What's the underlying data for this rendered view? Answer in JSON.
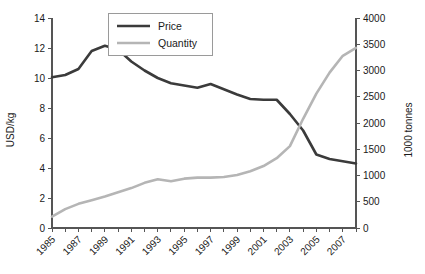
{
  "chart_data": {
    "type": "line",
    "title": "",
    "xlabel": "",
    "ylabel": "USD/kg",
    "y2label": "1000 tonnes",
    "grid": false,
    "legend_position": "top-center",
    "xlim": [
      1985,
      2008
    ],
    "ylim": [
      0,
      14
    ],
    "y2lim": [
      0,
      4000
    ],
    "x": [
      1985,
      1986,
      1987,
      1988,
      1989,
      1990,
      1991,
      1992,
      1993,
      1994,
      1995,
      1996,
      1997,
      1998,
      1999,
      2000,
      2001,
      2002,
      2003,
      2004,
      2005,
      2006,
      2007,
      2008
    ],
    "xticks": [
      1985,
      1987,
      1989,
      1991,
      1993,
      1995,
      1997,
      1999,
      2001,
      2003,
      2005,
      2007
    ],
    "xtick_labels": [
      "1985",
      "1987",
      "1989",
      "1991",
      "1993",
      "1995",
      "1997",
      "1999",
      "2001",
      "2003",
      "2005",
      "2007"
    ],
    "yticks": [
      0,
      2,
      4,
      6,
      8,
      10,
      12,
      14
    ],
    "ytick_labels": [
      "0",
      "2",
      "4",
      "6",
      "8",
      "10",
      "12",
      "14"
    ],
    "y2ticks": [
      0,
      500,
      1000,
      1500,
      2000,
      2500,
      3000,
      3500,
      4000
    ],
    "y2tick_labels": [
      "0",
      "500",
      "1000",
      "1500",
      "2000",
      "2500",
      "3000",
      "3500",
      "4000"
    ],
    "series": [
      {
        "name": "Price",
        "axis": "left",
        "color": "#3b3b3b",
        "width": 2.6,
        "values": [
          10.05,
          10.2,
          10.6,
          11.8,
          12.15,
          11.9,
          11.1,
          10.5,
          10.0,
          9.65,
          9.5,
          9.35,
          9.6,
          9.25,
          8.9,
          8.6,
          8.55,
          8.55,
          7.6,
          6.5,
          4.9,
          4.6,
          4.45,
          4.3
        ]
      },
      {
        "name": "Quantity",
        "axis": "right",
        "color": "#b5b5b5",
        "width": 2.6,
        "values": [
          215,
          360,
          460,
          530,
          600,
          680,
          760,
          860,
          930,
          890,
          940,
          960,
          960,
          970,
          1010,
          1080,
          1180,
          1330,
          1560,
          2080,
          2560,
          2960,
          3280,
          3430
        ]
      }
    ]
  },
  "legend": {
    "items": [
      {
        "label": "Price"
      },
      {
        "label": "Quantity"
      }
    ]
  },
  "axes": {
    "left_title": "USD/kg",
    "right_title": "1000 tonnes"
  },
  "colors": {
    "price": "#3b3b3b",
    "quantity": "#b5b5b5",
    "axis": "#555555",
    "text": "#1a1a1a",
    "background": "#ffffff"
  }
}
